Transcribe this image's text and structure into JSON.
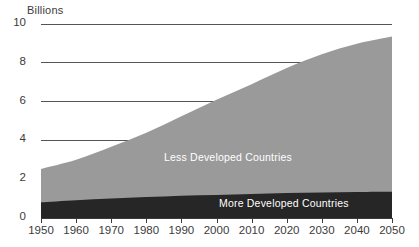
{
  "chart_data": {
    "type": "area",
    "stacked": true,
    "title": "",
    "ylabel": "Billions",
    "xlabel": "",
    "ylim": [
      0,
      10
    ],
    "xlim": [
      1950,
      2050
    ],
    "grid": true,
    "gridlines": [
      10,
      8,
      6,
      4
    ],
    "legend_position": "inside",
    "y_ticks": [
      {
        "value": 10,
        "label": "10"
      },
      {
        "value": 8,
        "label": "8"
      },
      {
        "value": 6,
        "label": "6"
      },
      {
        "value": 4,
        "label": "4"
      },
      {
        "value": 2,
        "label": "2"
      },
      {
        "value": 0,
        "label": "0"
      }
    ],
    "x_ticks": [
      {
        "value": 1950,
        "label": "1950"
      },
      {
        "value": 1960,
        "label": "1960"
      },
      {
        "value": 1970,
        "label": "1970"
      },
      {
        "value": 1980,
        "label": "1980"
      },
      {
        "value": 1990,
        "label": "1990"
      },
      {
        "value": 2000,
        "label": "2000"
      },
      {
        "value": 2010,
        "label": "2010"
      },
      {
        "value": 2020,
        "label": "2020"
      },
      {
        "value": 2030,
        "label": "2030"
      },
      {
        "value": 2040,
        "label": "2040"
      },
      {
        "value": 2050,
        "label": "2050"
      }
    ],
    "x": [
      1950,
      1960,
      1970,
      1980,
      1990,
      2000,
      2010,
      2020,
      2030,
      2040,
      2050
    ],
    "series": [
      {
        "name": "More Developed Countries",
        "color": "#262626",
        "text_color": "#ffffff",
        "values": [
          0.81,
          0.92,
          1.01,
          1.08,
          1.15,
          1.19,
          1.24,
          1.29,
          1.32,
          1.34,
          1.35
        ]
      },
      {
        "name": "Less Developed Countries",
        "color": "#9a9a9a",
        "text_color": "#ffffff",
        "values": [
          1.72,
          2.08,
          2.66,
          3.32,
          4.1,
          4.91,
          5.66,
          6.44,
          7.12,
          7.64,
          8.0
        ]
      }
    ],
    "totals": [
      2.53,
      3.0,
      3.67,
      4.4,
      5.25,
      6.1,
      6.9,
      7.73,
      8.44,
      8.98,
      9.35
    ],
    "colors": {
      "grid": "#555555",
      "axis": "#3b3b3b",
      "text": "#3b3b3b",
      "background": "#ffffff"
    }
  }
}
